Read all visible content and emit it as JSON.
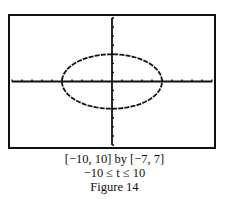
{
  "figure": {
    "caption_window": "[−10, 10] by [−7, 7]",
    "caption_param": "−10 ≤ t ≤ 10",
    "caption_label": "Figure 14"
  },
  "chart_data": {
    "type": "line",
    "title": "Figure 14",
    "xlim": [
      -10,
      10
    ],
    "ylim": [
      -7,
      7
    ],
    "t_range": [
      -10,
      10
    ],
    "x_tick_step": 1,
    "y_tick_step": 1,
    "grid": false,
    "series": [
      {
        "name": "ellipse",
        "x_expr": "5cos(t)",
        "y_expr": "3sin(t)",
        "semi_axis_x": 5,
        "semi_axis_y": 3
      }
    ],
    "colors": {
      "curve": "#111111",
      "axes": "#111111",
      "frame": "#111111",
      "background": "#ffffff"
    }
  }
}
